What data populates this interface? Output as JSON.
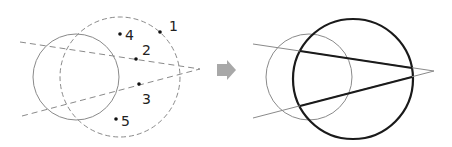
{
  "colors": {
    "background": "#ffffff",
    "thin_stroke": "#8a8a8a",
    "dashed_stroke": "#8a8a8a",
    "bold_stroke": "#1a1a1a",
    "arrow": "#a8a8a8",
    "point": "#111111"
  },
  "left_diagram": {
    "solid_circle": {
      "cx": 76,
      "cy": 77,
      "r": 43
    },
    "dashed_circle": {
      "cx": 120,
      "cy": 77,
      "r": 60
    },
    "apex": {
      "x": 200,
      "y": 69
    },
    "dashed_lines": [
      {
        "x1": 20,
        "y1": 42,
        "x2": 200,
        "y2": 69
      },
      {
        "x1": 22,
        "y1": 116,
        "x2": 200,
        "y2": 69
      }
    ],
    "points": [
      {
        "id": "1",
        "label": "1",
        "x": 160,
        "y": 32,
        "lx": 169,
        "ly": 31
      },
      {
        "id": "2",
        "label": "2",
        "x": 136,
        "y": 59,
        "lx": 142,
        "ly": 55
      },
      {
        "id": "3",
        "label": "3",
        "x": 139,
        "y": 84,
        "lx": 142,
        "ly": 104
      },
      {
        "id": "4",
        "label": "4",
        "x": 120,
        "y": 34,
        "lx": 125,
        "ly": 40
      },
      {
        "id": "5",
        "label": "5",
        "x": 116,
        "y": 119,
        "lx": 121,
        "ly": 126
      }
    ]
  },
  "arrow": {
    "label": "transforms-to"
  },
  "right_diagram": {
    "thin_circle": {
      "cx": 309,
      "cy": 77,
      "r": 43
    },
    "bold_circle": {
      "cx": 353,
      "cy": 79,
      "r": 60
    },
    "apex": {
      "x": 434,
      "y": 71
    },
    "thin_lines": [
      {
        "x1": 253,
        "y1": 44,
        "x2": 434,
        "y2": 71
      },
      {
        "x1": 253,
        "y1": 118,
        "x2": 434,
        "y2": 71
      }
    ],
    "bold_segments": [
      {
        "x1": 300,
        "y1": 51,
        "x2": 412,
        "y2": 68
      },
      {
        "x1": 300,
        "y1": 106,
        "x2": 412,
        "y2": 77
      }
    ]
  }
}
